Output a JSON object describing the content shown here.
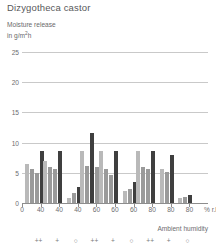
{
  "header": {
    "species_title": "Dizygotheca castor"
  },
  "axis": {
    "y_label_line1": "Moisture release",
    "y_label_line2_pre": "in g/m",
    "y_label_line2_sup": "2",
    "y_label_line2_post": "h",
    "x_unit": "% r.h.",
    "x_caption": "Ambient humidity"
  },
  "chart_data": {
    "type": "bar",
    "title": "Dizygotheca castor",
    "xlabel": "Ambient humidity",
    "ylabel": "Moisture release in g/m2h",
    "x_unit": "% r.h.",
    "ylim": [
      0,
      27
    ],
    "yticks": [
      0,
      5,
      10,
      15,
      20,
      25
    ],
    "ytick_labels": [
      "0",
      "5",
      "10",
      "15",
      "20",
      "25"
    ],
    "grid": true,
    "legend": "none",
    "xtick_labels": [
      "0",
      "40",
      "40",
      "40",
      "60",
      "60",
      "60",
      "80",
      "80",
      "80"
    ],
    "condition_symbols": [
      "++",
      "+",
      "○",
      "++",
      "+",
      "○",
      "++",
      "+",
      "○"
    ],
    "colors": {
      "light": "#b9b9b9",
      "mid": "#9a9a9a",
      "dark": "#3f3f3f",
      "gridline": "#c9c9c9",
      "axis": "#8d8d8d",
      "text": "#6d6d6f",
      "title": "#58585a"
    },
    "groups": [
      {
        "humidity": "40",
        "symbol": "++",
        "values": [
          6.5,
          5.6,
          5.0,
          8.6
        ],
        "shades": [
          "light",
          "mid",
          "mid",
          "dark"
        ]
      },
      {
        "humidity": "40",
        "symbol": "+",
        "values": [
          7.0,
          6.0,
          5.6,
          8.6
        ],
        "shades": [
          "light",
          "mid",
          "mid",
          "dark"
        ]
      },
      {
        "humidity": "40",
        "symbol": "○",
        "values": [
          0.8,
          1.6,
          2.6
        ],
        "shades": [
          "light",
          "mid",
          "dark"
        ]
      },
      {
        "humidity": "60",
        "symbol": "++",
        "values": [
          8.6,
          6.2,
          11.6,
          6.0
        ],
        "shades": [
          "light",
          "mid",
          "dark",
          "mid"
        ]
      },
      {
        "humidity": "60",
        "symbol": "+",
        "values": [
          8.6,
          5.6,
          4.6,
          8.6
        ],
        "shades": [
          "light",
          "mid",
          "mid",
          "dark"
        ]
      },
      {
        "humidity": "60",
        "symbol": "○",
        "values": [
          2.0,
          2.4,
          3.4
        ],
        "shades": [
          "light",
          "mid",
          "dark"
        ]
      },
      {
        "humidity": "80",
        "symbol": "++",
        "values": [
          8.6,
          6.0,
          5.6,
          8.6
        ],
        "shades": [
          "light",
          "mid",
          "mid",
          "dark"
        ]
      },
      {
        "humidity": "80",
        "symbol": "+",
        "values": [
          5.6,
          5.2,
          8.0
        ],
        "shades": [
          "light",
          "mid",
          "dark"
        ]
      },
      {
        "humidity": "80",
        "symbol": "○",
        "values": [
          0.9,
          1.0,
          1.3
        ],
        "shades": [
          "light",
          "mid",
          "dark"
        ]
      }
    ]
  }
}
